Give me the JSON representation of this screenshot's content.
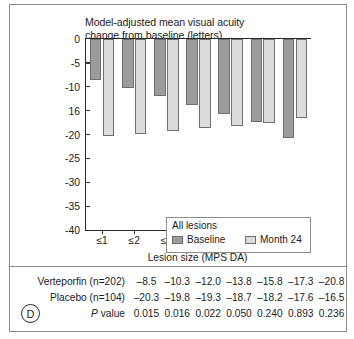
{
  "figure": {
    "panel_marker": "D"
  },
  "chart_data": {
    "type": "bar",
    "title": "Model-adjusted mean visual acuity change from baseline (letters)",
    "title_line1": "Model-adjusted mean visual acuity",
    "title_line2": "change from baseline (letters)",
    "xlabel": "Lesion size (MPS DA)",
    "ylabel": "",
    "categories": [
      "≤1",
      "≤2",
      "≤3",
      "≤4",
      "≤5",
      "≤6",
      "≤9"
    ],
    "ylim": [
      -40,
      0
    ],
    "yticks": [
      0,
      -5,
      -10,
      -15,
      -20,
      -25,
      -30,
      -35,
      -40
    ],
    "ytick_labels": [
      "0",
      "-5",
      "-10",
      "16",
      "-20",
      "-25",
      "-30",
      "-35",
      "-40"
    ],
    "grid": false,
    "legend_position": "inside-lower-left",
    "legend_title": "All lesions",
    "series": [
      {
        "name": "Baseline",
        "color": "#9c9c9c",
        "values": [
          -8.5,
          -10.3,
          -12.0,
          -13.8,
          -15.8,
          -17.3,
          -20.8
        ]
      },
      {
        "name": "Month 24",
        "color": "#dcdcdc",
        "values": [
          -20.3,
          -19.8,
          -19.3,
          -18.7,
          -18.2,
          -17.6,
          -16.5
        ]
      }
    ]
  },
  "table": {
    "rows": [
      {
        "label": "Verteporfin (n=202)",
        "label_italic_prefix": "",
        "values": [
          "–8.5",
          "–10.3",
          "–12.0",
          "–13.8",
          "–15.8",
          "–17.3",
          "–20.8"
        ]
      },
      {
        "label": "Placebo (n=104)",
        "label_italic_prefix": "",
        "values": [
          "–20.3",
          "–19.8",
          "–19.3",
          "–18.7",
          "–18.2",
          "–17.6",
          "–16.5"
        ]
      },
      {
        "label": "value",
        "label_italic_prefix": "P",
        "values": [
          "0.015",
          "0.016",
          "0.022",
          "0.050",
          "0.240",
          "0.893",
          "0.236"
        ]
      }
    ]
  }
}
